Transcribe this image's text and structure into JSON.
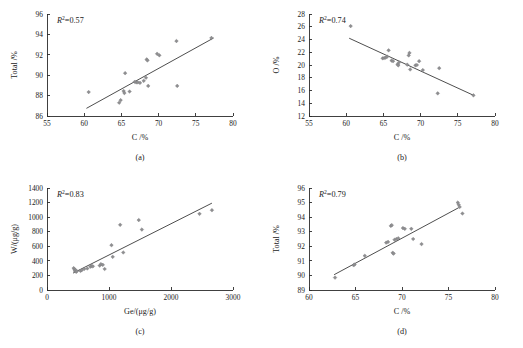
{
  "figure": {
    "caption_a": "(a)",
    "caption_b": "(b)",
    "caption_c": "(c)",
    "caption_d": "(d)",
    "marker_color": "#8e8e90",
    "line_color": "#3a3a3a",
    "axis_color": "#2b2b2b"
  },
  "chart_data": [
    {
      "id": "panel-a",
      "type": "scatter",
      "title": "",
      "panel_label": "(a)",
      "xlabel": "C /%",
      "ylabel": "Total /%",
      "xlim": [
        55,
        80
      ],
      "ylim": [
        86,
        96
      ],
      "xticks": [
        55,
        60,
        65,
        70,
        75,
        80
      ],
      "yticks": [
        86,
        88,
        90,
        92,
        94,
        96
      ],
      "grid": false,
      "annotation": "R2=0.57",
      "annotation_r": "R",
      "annotation_sup": "2",
      "annotation_value": "=0.57",
      "r_squared": 0.57,
      "trendline": {
        "x": [
          60.3,
          77.4
        ],
        "y": [
          86.75,
          93.65
        ]
      },
      "points": [
        {
          "x": 60.6,
          "y": 88.35
        },
        {
          "x": 64.7,
          "y": 87.3
        },
        {
          "x": 64.9,
          "y": 87.55
        },
        {
          "x": 65.3,
          "y": 88.45
        },
        {
          "x": 65.4,
          "y": 88.25
        },
        {
          "x": 65.5,
          "y": 90.2
        },
        {
          "x": 66.1,
          "y": 88.4
        },
        {
          "x": 66.8,
          "y": 89.35
        },
        {
          "x": 67.0,
          "y": 89.3
        },
        {
          "x": 67.2,
          "y": 89.3
        },
        {
          "x": 67.5,
          "y": 89.25
        },
        {
          "x": 68.0,
          "y": 89.45
        },
        {
          "x": 68.3,
          "y": 89.75
        },
        {
          "x": 68.4,
          "y": 91.55
        },
        {
          "x": 68.5,
          "y": 91.45
        },
        {
          "x": 68.6,
          "y": 88.95
        },
        {
          "x": 69.8,
          "y": 92.1
        },
        {
          "x": 70.1,
          "y": 91.95
        },
        {
          "x": 72.4,
          "y": 93.35
        },
        {
          "x": 72.5,
          "y": 88.95
        },
        {
          "x": 77.1,
          "y": 93.65
        }
      ]
    },
    {
      "id": "panel-b",
      "type": "scatter",
      "title": "",
      "panel_label": "(b)",
      "xlabel": "C /%",
      "ylabel": "O /%",
      "xlim": [
        55,
        80
      ],
      "ylim": [
        12,
        28
      ],
      "xticks": [
        55,
        60,
        65,
        70,
        75,
        80
      ],
      "yticks": [
        12,
        14,
        16,
        18,
        20,
        22,
        24,
        26,
        28
      ],
      "grid": false,
      "annotation": "R2=0.74",
      "annotation_r": "R",
      "annotation_sup": "2",
      "annotation_value": "=0.74",
      "r_squared": 0.74,
      "trendline": {
        "x": [
          60.4,
          77.2
        ],
        "y": [
          24.2,
          15.2
        ]
      },
      "points": [
        {
          "x": 60.6,
          "y": 26.1
        },
        {
          "x": 64.9,
          "y": 21.05
        },
        {
          "x": 65.1,
          "y": 21.1
        },
        {
          "x": 65.3,
          "y": 21.15
        },
        {
          "x": 65.5,
          "y": 21.3
        },
        {
          "x": 65.7,
          "y": 22.3
        },
        {
          "x": 66.1,
          "y": 20.7
        },
        {
          "x": 66.3,
          "y": 20.6
        },
        {
          "x": 66.9,
          "y": 20.1
        },
        {
          "x": 67.0,
          "y": 19.95
        },
        {
          "x": 67.1,
          "y": 20.4
        },
        {
          "x": 68.2,
          "y": 20.05
        },
        {
          "x": 68.4,
          "y": 21.5
        },
        {
          "x": 68.5,
          "y": 21.9
        },
        {
          "x": 68.6,
          "y": 19.3
        },
        {
          "x": 69.3,
          "y": 19.95
        },
        {
          "x": 69.5,
          "y": 20.0
        },
        {
          "x": 69.8,
          "y": 20.6
        },
        {
          "x": 70.3,
          "y": 19.2
        },
        {
          "x": 72.3,
          "y": 15.55
        },
        {
          "x": 72.5,
          "y": 19.5
        },
        {
          "x": 77.1,
          "y": 15.25
        }
      ]
    },
    {
      "id": "panel-c",
      "type": "scatter",
      "title": "",
      "panel_label": "(c)",
      "xlabel": "Ge/(μg/g)",
      "ylabel": "W/(μg/g)",
      "xlim": [
        0,
        3000
      ],
      "ylim": [
        0,
        1400
      ],
      "xticks": [
        0,
        1000,
        2000,
        3000
      ],
      "yticks": [
        0,
        200,
        400,
        600,
        800,
        1000,
        1200,
        1400
      ],
      "grid": false,
      "annotation": "R2=0.83",
      "annotation_r": "R",
      "annotation_sup": "2",
      "annotation_value": "=0.83",
      "r_squared": 0.83,
      "trendline": {
        "x": [
          420,
          2660
        ],
        "y": [
          232,
          1192
        ]
      },
      "points": [
        {
          "x": 430,
          "y": 300
        },
        {
          "x": 445,
          "y": 285
        },
        {
          "x": 450,
          "y": 262
        },
        {
          "x": 460,
          "y": 272
        },
        {
          "x": 470,
          "y": 250
        },
        {
          "x": 480,
          "y": 258
        },
        {
          "x": 540,
          "y": 262
        },
        {
          "x": 560,
          "y": 272
        },
        {
          "x": 600,
          "y": 288
        },
        {
          "x": 650,
          "y": 295
        },
        {
          "x": 700,
          "y": 320
        },
        {
          "x": 720,
          "y": 330
        },
        {
          "x": 740,
          "y": 325
        },
        {
          "x": 850,
          "y": 335
        },
        {
          "x": 870,
          "y": 355
        },
        {
          "x": 900,
          "y": 345
        },
        {
          "x": 930,
          "y": 288
        },
        {
          "x": 1040,
          "y": 615
        },
        {
          "x": 1060,
          "y": 455
        },
        {
          "x": 1180,
          "y": 895
        },
        {
          "x": 1230,
          "y": 515
        },
        {
          "x": 1480,
          "y": 960
        },
        {
          "x": 1530,
          "y": 830
        },
        {
          "x": 2460,
          "y": 1045
        },
        {
          "x": 2660,
          "y": 1095
        }
      ]
    },
    {
      "id": "panel-d",
      "type": "scatter",
      "title": "",
      "panel_label": "(d)",
      "xlabel": "C /%",
      "ylabel": "Total /%",
      "xlim": [
        60,
        80
      ],
      "ylim": [
        89,
        96
      ],
      "xticks": [
        60,
        65,
        70,
        75,
        80
      ],
      "yticks": [
        89,
        90,
        91,
        92,
        93,
        94,
        95,
        96
      ],
      "grid": false,
      "annotation": "R2=0.79",
      "annotation_r": "R",
      "annotation_sup": "2",
      "annotation_value": "=0.79",
      "r_squared": 0.79,
      "trendline": {
        "x": [
          62.7,
          76.1
        ],
        "y": [
          90.05,
          94.65
        ]
      },
      "points": [
        {
          "x": 62.8,
          "y": 89.85
        },
        {
          "x": 64.8,
          "y": 90.7
        },
        {
          "x": 64.9,
          "y": 90.75
        },
        {
          "x": 66.0,
          "y": 91.35
        },
        {
          "x": 68.3,
          "y": 92.25
        },
        {
          "x": 68.5,
          "y": 92.3
        },
        {
          "x": 68.8,
          "y": 93.4
        },
        {
          "x": 68.9,
          "y": 93.45
        },
        {
          "x": 69.0,
          "y": 91.55
        },
        {
          "x": 69.1,
          "y": 91.5
        },
        {
          "x": 69.2,
          "y": 92.45
        },
        {
          "x": 69.4,
          "y": 92.5
        },
        {
          "x": 69.6,
          "y": 92.55
        },
        {
          "x": 70.1,
          "y": 93.25
        },
        {
          "x": 70.3,
          "y": 93.2
        },
        {
          "x": 71.0,
          "y": 93.2
        },
        {
          "x": 71.2,
          "y": 92.5
        },
        {
          "x": 72.1,
          "y": 92.15
        },
        {
          "x": 76.0,
          "y": 95.0
        },
        {
          "x": 76.1,
          "y": 94.85
        },
        {
          "x": 76.2,
          "y": 94.7
        },
        {
          "x": 76.5,
          "y": 94.25
        }
      ]
    }
  ]
}
